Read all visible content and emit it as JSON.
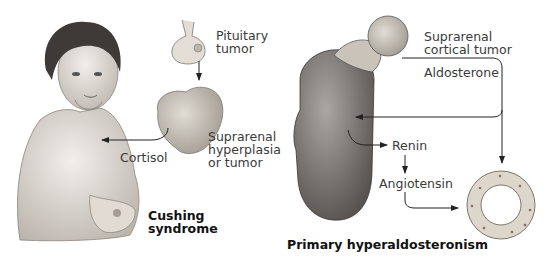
{
  "left_panel": {
    "title_line1": "Cushing",
    "title_line2": "syndrome",
    "labels": {
      "pituitary_line1": "Pituitary",
      "pituitary_line2": "tumor",
      "suprarenal_line1": "Suprarenal",
      "suprarenal_line2": "hyperplasia",
      "suprarenal_line3": "or tumor",
      "hormone": "Cortisol"
    }
  },
  "right_panel": {
    "title": "Primary hyperaldosteronism",
    "labels": {
      "tumor_line1": "Suprarenal",
      "tumor_line2": "cortical tumor",
      "hormone": "Aldosterone",
      "renin": "Renin",
      "angiotensin": "Angiotensin"
    }
  },
  "colors": {
    "skin": "#e6e0da",
    "kidney": "#7d7a78",
    "gland": "#cfc9c0",
    "arrow": "#222222"
  }
}
